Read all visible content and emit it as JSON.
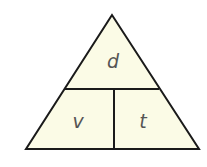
{
  "diagram": {
    "type": "formula-triangle",
    "fill_color": "#fbfbe6",
    "stroke_color": "#1a1a1a",
    "top_label": "d",
    "bottom_left_label": "v",
    "bottom_right_label": "t"
  }
}
